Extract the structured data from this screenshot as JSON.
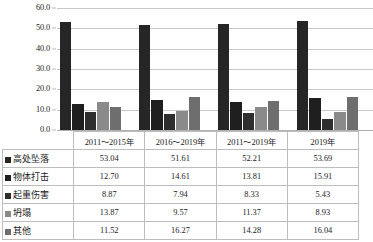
{
  "chart_data": {
    "type": "bar",
    "title": "",
    "subtitle": "",
    "xlabel": "",
    "ylabel": "",
    "grid": true,
    "legend_position": "table-row-headers",
    "ylim": [
      0,
      60
    ],
    "ytick_step": 10,
    "ytick_labels": [
      "60.0",
      "50.0",
      "40.0",
      "30.0",
      "20.0",
      "10.0",
      "0.0"
    ],
    "ytick_values": [
      60,
      50,
      40,
      30,
      20,
      10,
      0
    ],
    "categories": [
      "2011～2015年",
      "2016～2019年",
      "2011～2019年",
      "2019年"
    ],
    "series": [
      {
        "name": "高处坠落",
        "color": "#262626",
        "values": [
          53.04,
          51.61,
          52.21,
          53.69
        ]
      },
      {
        "name": "物体打击",
        "color": "#1f1f1f",
        "values": [
          12.7,
          14.61,
          13.81,
          15.91
        ]
      },
      {
        "name": "起重伤害",
        "color": "#2e2e2e",
        "values": [
          8.87,
          7.94,
          8.33,
          5.43
        ]
      },
      {
        "name": "坍塌",
        "color": "#8a8a8a",
        "values": [
          13.87,
          9.57,
          11.37,
          8.93
        ]
      },
      {
        "name": "其他",
        "color": "#6e6e6e",
        "values": [
          11.52,
          16.27,
          14.28,
          16.04
        ]
      }
    ]
  },
  "table": {
    "corner_label": "",
    "column_headers": [
      "2011～2015年",
      "2016～2019年",
      "2011～2019年",
      "2019年"
    ],
    "rows": [
      {
        "label": "高处坠落",
        "swatch": "#262626",
        "values": [
          "53.04",
          "51.61",
          "52.21",
          "53.69"
        ]
      },
      {
        "label": "物体打击",
        "swatch": "#1f1f1f",
        "values": [
          "12.70",
          "14.61",
          "13.81",
          "15.91"
        ]
      },
      {
        "label": "起重伤害",
        "swatch": "#2e2e2e",
        "values": [
          "8.87",
          "7.94",
          "8.33",
          "5.43"
        ]
      },
      {
        "label": "坍塌",
        "swatch": "#8a8a8a",
        "values": [
          "13.87",
          "9.57",
          "11.37",
          "8.93"
        ]
      },
      {
        "label": "其他",
        "swatch": "#6e6e6e",
        "values": [
          "11.52",
          "16.27",
          "14.28",
          "16.04"
        ]
      }
    ]
  }
}
